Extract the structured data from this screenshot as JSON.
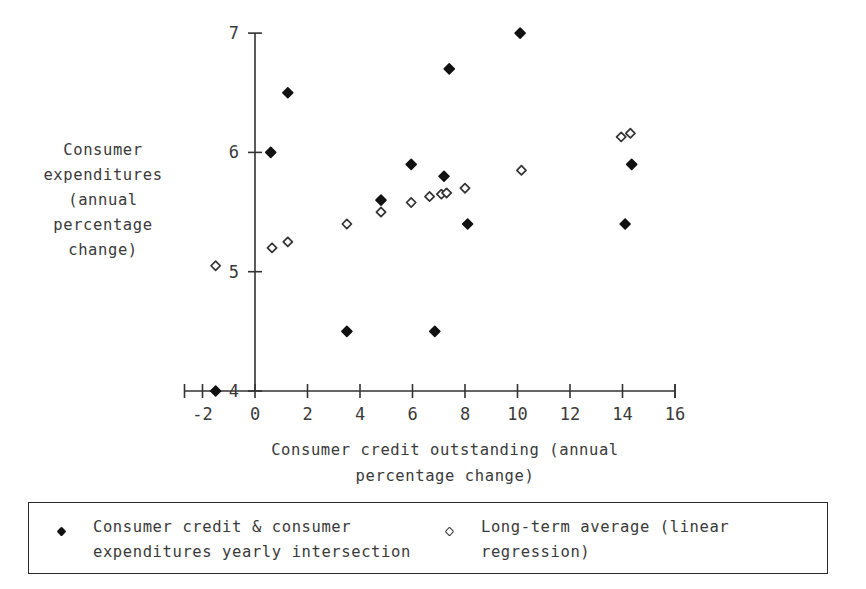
{
  "chart_data": {
    "type": "scatter",
    "title": "",
    "xlabel": "Consumer credit outstanding (annual\npercentage change)",
    "xlabel_lines": [
      "Consumer credit outstanding (annual",
      "percentage change)"
    ],
    "ylabel": "Consumer expenditures (annual percentage change)",
    "ylabel_lines": [
      "Consumer",
      "expenditures",
      "(annual",
      "percentage",
      "change)"
    ],
    "xlim": [
      -2,
      16
    ],
    "ylim": [
      4,
      7
    ],
    "xticks": [
      -2,
      0,
      2,
      4,
      6,
      8,
      10,
      12,
      14,
      16
    ],
    "yticks": [
      4,
      5,
      6,
      7
    ],
    "xtick_labels": [
      "-2",
      "0",
      "2",
      "4",
      "6",
      "8",
      "10",
      "12",
      "14",
      "16"
    ],
    "ytick_labels": [
      "4",
      "5",
      "6",
      "7"
    ],
    "grid": false,
    "legend_position": "below-plot",
    "marker_color": "#111111",
    "axis_color": "#333333",
    "series": [
      {
        "name": "Consumer credit & consumer expenditures yearly intersection",
        "marker": "filled-diamond",
        "color": "#111111",
        "points": [
          {
            "x": -1.5,
            "y": 4.0
          },
          {
            "x": 0.6,
            "y": 6.0
          },
          {
            "x": 1.25,
            "y": 6.5
          },
          {
            "x": 3.5,
            "y": 4.5
          },
          {
            "x": 4.8,
            "y": 5.6
          },
          {
            "x": 5.95,
            "y": 5.9
          },
          {
            "x": 6.85,
            "y": 4.5
          },
          {
            "x": 7.2,
            "y": 5.8
          },
          {
            "x": 7.4,
            "y": 6.7
          },
          {
            "x": 8.1,
            "y": 5.4
          },
          {
            "x": 10.1,
            "y": 7.0
          },
          {
            "x": 14.1,
            "y": 5.4
          },
          {
            "x": 14.35,
            "y": 5.9
          }
        ]
      },
      {
        "name": "Long-term average (linear regression)",
        "marker": "open-diamond",
        "color": "#333333",
        "points": [
          {
            "x": -1.5,
            "y": 5.05
          },
          {
            "x": 0.65,
            "y": 5.2
          },
          {
            "x": 1.25,
            "y": 5.25
          },
          {
            "x": 3.5,
            "y": 5.4
          },
          {
            "x": 4.8,
            "y": 5.5
          },
          {
            "x": 5.95,
            "y": 5.58
          },
          {
            "x": 6.65,
            "y": 5.63
          },
          {
            "x": 7.1,
            "y": 5.65
          },
          {
            "x": 7.3,
            "y": 5.66
          },
          {
            "x": 8.0,
            "y": 5.7
          },
          {
            "x": 10.15,
            "y": 5.85
          },
          {
            "x": 13.95,
            "y": 6.13
          },
          {
            "x": 14.3,
            "y": 6.16
          }
        ]
      }
    ]
  },
  "legend": {
    "entries": [
      {
        "marker": "filled-diamond",
        "label": "Consumer credit & consumer\nexpenditures yearly intersection"
      },
      {
        "marker": "open-diamond",
        "label": "Long-term average (linear\nregression)"
      }
    ]
  }
}
